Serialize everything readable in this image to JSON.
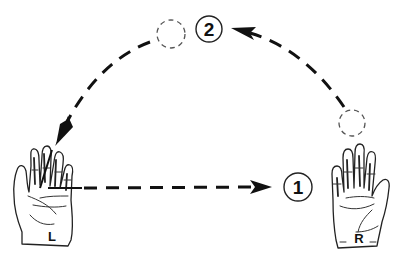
{
  "diagram": {
    "hands": {
      "left": {
        "label": "L"
      },
      "right": {
        "label": "R"
      }
    },
    "positions": {
      "first": {
        "label": "1",
        "note": "horizontal pass from left hand to right side"
      },
      "second": {
        "label": "2",
        "note": "top of arc"
      }
    },
    "paths": [
      {
        "id": "pass-1",
        "from": "left-hand",
        "to": "position-1",
        "style": "dashed",
        "direction": "left-to-right"
      },
      {
        "id": "arc-up",
        "from": "right-ghost-ball",
        "to": "position-2",
        "style": "dashed",
        "direction": "right-to-top"
      },
      {
        "id": "arc-down",
        "from": "top-ghost-ball",
        "to": "left-hand",
        "style": "dashed",
        "direction": "top-to-left"
      }
    ],
    "ghost_balls": [
      "top-left of position 2",
      "above right hand"
    ],
    "colors": {
      "ink": "#111111",
      "background": "#ffffff"
    }
  }
}
